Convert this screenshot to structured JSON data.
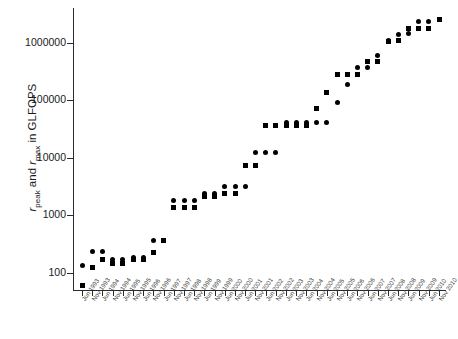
{
  "chart_data": {
    "type": "scatter",
    "title": "",
    "xlabel": "",
    "ylabel": "r_peak and r_max in GLFOPS",
    "ylabel_parts": {
      "sym1": "r",
      "sub1": "peak",
      "mid": " and ",
      "sym2": "r",
      "sub2": "max",
      "tail": " in GLFOPS"
    },
    "yscale": "log",
    "ylim": [
      50,
      4000000
    ],
    "yticks": [
      100,
      1000,
      10000,
      100000,
      1000000
    ],
    "ytick_labels": [
      "100",
      "1000",
      "10000",
      "100000",
      "1000000"
    ],
    "grid": false,
    "legend": "none",
    "marker_styles": {
      "r_peak": "circle",
      "r_max": "square"
    },
    "categories": [
      "Jun 1993",
      "Nov 1993",
      "Jun 1994",
      "Nov 1994",
      "Jun 1995",
      "Nov 1995",
      "Jun 1996",
      "Nov 1996",
      "Jun 1997",
      "Nov 1997",
      "Jun 1998",
      "Nov 1998",
      "Jun 1999",
      "Nov 1999",
      "Jun 2000",
      "Nov 2000",
      "Jun 2001",
      "Nov 2001",
      "Jun 2002",
      "Nov 2002",
      "Jun 2003",
      "Nov 2003",
      "Jun 2004",
      "Nov 2004",
      "Jun 2005",
      "Nov 2005",
      "Jun 2006",
      "Nov 2006",
      "Jun 2007",
      "Nov 2007",
      "Jun 2008",
      "Nov 2008",
      "Jun 2009",
      "Nov 2009",
      "Jun 2010",
      "Nov 2010"
    ],
    "series": [
      {
        "name": "r_peak",
        "marker": "circle",
        "values": [
          131,
          236,
          236,
          170,
          170,
          185,
          185,
          368,
          368,
          1800,
          1830,
          1830,
          2380,
          2380,
          3210,
          3210,
          3210,
          12300,
          12300,
          12300,
          40960,
          40960,
          40960,
          40960,
          40960,
          91750,
          183500,
          367000,
          367000,
          596000,
          1105000,
          1381000,
          1456000,
          2331000,
          2331000,
          2566000
        ]
      },
      {
        "name": "r_max",
        "marker": "square",
        "values": [
          60,
          124,
          170,
          143,
          143,
          170,
          170,
          220,
          368,
          1340,
          1340,
          1340,
          2120,
          2120,
          2380,
          2380,
          7230,
          7230,
          35860,
          35860,
          35860,
          35860,
          35860,
          70720,
          136800,
          280600,
          280600,
          280600,
          478200,
          478200,
          1026000,
          1105000,
          1759000,
          1759000,
          1759000,
          2566000
        ]
      }
    ]
  }
}
